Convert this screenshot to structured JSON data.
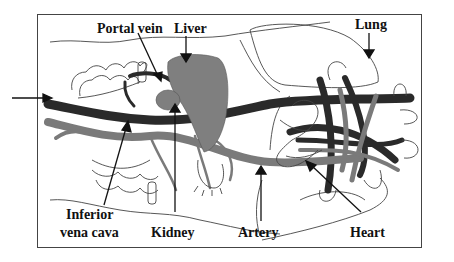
{
  "diagram": {
    "labels": {
      "portal_vein": "Portal vein",
      "liver": "Liver",
      "lung": "Lung",
      "inferior_vena_cava_line1": "Inferior",
      "inferior_vena_cava_line2": "vena cava",
      "kidney": "Kidney",
      "artery": "Artery",
      "heart": "Heart"
    },
    "colors": {
      "vein_dark": "#2a2a2a",
      "artery_gray": "#7a7a7a",
      "organ_gray": "#7f7f7f",
      "outline": "#333333",
      "background": "#ffffff"
    }
  }
}
